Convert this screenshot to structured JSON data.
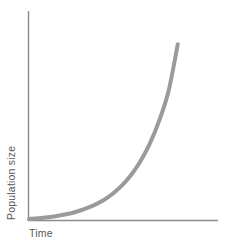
{
  "figure": {
    "background_color": "#ffffff",
    "width": 225,
    "height": 250
  },
  "axes": {
    "color": "#8b8b8b",
    "x_axis_label": "Time",
    "y_axis_label": "Population size",
    "label_color": "#58585a"
  },
  "caption": {
    "sliver_text": ""
  },
  "chart_data": {
    "type": "line",
    "title": "",
    "subtitle": "",
    "xlabel": "Time",
    "ylabel": "Population size",
    "grid": false,
    "legend": null,
    "legend_position": "none",
    "tick_labels_x": [],
    "tick_labels_y": [],
    "xlim": [
      0,
      1
    ],
    "ylim": [
      0,
      1
    ],
    "annotations": [],
    "series": [
      {
        "name": "Exponential growth",
        "color": "#9a9a9a",
        "line_width": 4,
        "x": [
          0.0,
          0.05,
          0.1,
          0.15,
          0.2,
          0.25,
          0.3,
          0.35,
          0.4,
          0.45,
          0.5,
          0.55,
          0.6,
          0.65,
          0.7,
          0.75,
          0.8
        ],
        "y": [
          0.0,
          0.004,
          0.009,
          0.016,
          0.025,
          0.037,
          0.053,
          0.073,
          0.099,
          0.133,
          0.177,
          0.233,
          0.305,
          0.398,
          0.518,
          0.672,
          0.92
        ]
      }
    ]
  }
}
